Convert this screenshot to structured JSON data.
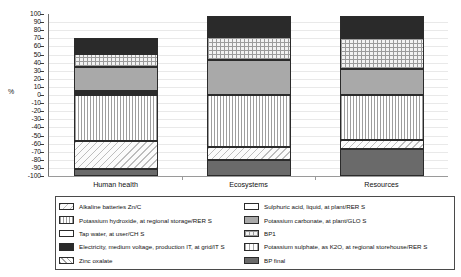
{
  "axis": {
    "ylabel": "%",
    "yticks": [
      100,
      90,
      80,
      70,
      60,
      50,
      40,
      30,
      20,
      10,
      0,
      -10,
      -20,
      -30,
      -40,
      -50,
      -60,
      -70,
      -80,
      -90,
      -100
    ],
    "categories": [
      "Human health",
      "Ecosystems",
      "Resources"
    ]
  },
  "legend": {
    "left": [
      {
        "name": "alkaline-batteries",
        "label": "Alkaline batteries Zn/C",
        "pattern": "p-alkaline"
      },
      {
        "name": "potassium-hydroxide",
        "label": "Potassium hydroxide, at regional storage/RER S",
        "pattern": "p-koh"
      },
      {
        "name": "tap-water",
        "label": "Tap water, at user/CH S",
        "pattern": "p-tap"
      },
      {
        "name": "electricity",
        "label": "Electricity, medium voltage, production IT, at grid/IT S",
        "pattern": "p-elec"
      },
      {
        "name": "zinc-oxalate",
        "label": "Zinc oxalate",
        "pattern": "p-zinc"
      }
    ],
    "right": [
      {
        "name": "sulphuric-acid",
        "label": "Sulphuric acid, liquid, at plant/RER S",
        "pattern": "p-sulph"
      },
      {
        "name": "potassium-carbonate",
        "label": "Potassium carbonate, at plant/GLO S",
        "pattern": "p-kcarb"
      },
      {
        "name": "bp1",
        "label": "BP1",
        "pattern": "p-bp1"
      },
      {
        "name": "potassium-sulphate",
        "label": "Potassium sulphate, as K2O, at regional storehouse/RER S",
        "pattern": "p-ksulph"
      },
      {
        "name": "bp-final",
        "label": "BP final",
        "pattern": "p-bpfinal"
      }
    ]
  },
  "chart_data": {
    "type": "bar",
    "title": "",
    "xlabel": "",
    "ylabel": "%",
    "ylim": [
      -100,
      100
    ],
    "ytick_step": 10,
    "grid": true,
    "stacked": true,
    "legend_position": "bottom",
    "categories": [
      "Human health",
      "Ecosystems",
      "Resources"
    ],
    "series": [
      {
        "name": "Alkaline batteries Zn/C",
        "pattern": "p-alkaline",
        "values": [
          -34,
          -16,
          -12
        ]
      },
      {
        "name": "Potassium hydroxide, at regional storage/RER S",
        "pattern": "p-koh",
        "values": [
          -57,
          -64,
          -55
        ]
      },
      {
        "name": "Tap water, at user/CH S",
        "pattern": "p-tap",
        "values": [
          1,
          0,
          0
        ]
      },
      {
        "name": "Electricity, medium voltage, production IT, at grid/IT S",
        "pattern": "p-elec",
        "values": [
          19,
          26,
          27
        ]
      },
      {
        "name": "Zinc oxalate",
        "pattern": "p-zinc",
        "values": [
          0,
          0,
          0
        ]
      },
      {
        "name": "Sulphuric acid, liquid, at plant/RER S",
        "pattern": "p-sulph",
        "values": [
          2,
          0,
          0
        ]
      },
      {
        "name": "Potassium carbonate, at plant/GLO S",
        "pattern": "p-kcarb",
        "values": [
          29,
          43,
          32
        ]
      },
      {
        "name": "BP1",
        "pattern": "p-bp1",
        "values": [
          17,
          29,
          38
        ]
      },
      {
        "name": "Potassium sulphate, as K2O, at regional storehouse/RER S",
        "pattern": "p-ksulph",
        "values": [
          2,
          0,
          0
        ]
      },
      {
        "name": "BP final",
        "pattern": "p-bpfinal",
        "values": [
          -9,
          -20,
          -33
        ]
      }
    ],
    "bars": [
      {
        "category": "Human health",
        "positive_total": 70,
        "negative_total": -100,
        "positive_segments": [
          {
            "name": "Sulphuric acid, liquid, at plant/RER S",
            "pattern": "p-sulph",
            "from": 1,
            "to": 3
          },
          {
            "name": "Potassium sulphate, as K2O, at regional storehouse/RER S",
            "pattern": "p-ksulph",
            "from": 3,
            "to": 5
          },
          {
            "name": "Potassium carbonate, at plant/GLO S",
            "pattern": "p-kcarb",
            "from": 5,
            "to": 34
          },
          {
            "name": "BP1",
            "pattern": "p-bp1",
            "from": 34,
            "to": 51
          },
          {
            "name": "Electricity, medium voltage, production IT, at grid/IT S",
            "pattern": "p-elec",
            "from": 51,
            "to": 70
          }
        ],
        "negative_segments": [
          {
            "name": "Potassium hydroxide, at regional storage/RER S",
            "pattern": "p-koh",
            "from": 0,
            "to": -57
          },
          {
            "name": "Alkaline batteries Zn/C",
            "pattern": "p-alkaline",
            "from": -57,
            "to": -91
          },
          {
            "name": "BP final",
            "pattern": "p-bpfinal",
            "from": -91,
            "to": -100
          }
        ]
      },
      {
        "category": "Ecosystems",
        "positive_total": 98,
        "negative_total": -100,
        "positive_segments": [
          {
            "name": "Potassium carbonate, at plant/GLO S",
            "pattern": "p-kcarb",
            "from": 0,
            "to": 43
          },
          {
            "name": "BP1",
            "pattern": "p-bp1",
            "from": 43,
            "to": 72
          },
          {
            "name": "Electricity, medium voltage, production IT, at grid/IT S",
            "pattern": "p-elec",
            "from": 72,
            "to": 98
          }
        ],
        "negative_segments": [
          {
            "name": "Potassium hydroxide, at regional storage/RER S",
            "pattern": "p-koh",
            "from": 0,
            "to": -64
          },
          {
            "name": "Alkaline batteries Zn/C",
            "pattern": "p-alkaline",
            "from": -64,
            "to": -80
          },
          {
            "name": "BP final",
            "pattern": "p-bpfinal",
            "from": -80,
            "to": -100
          }
        ]
      },
      {
        "category": "Resources",
        "positive_total": 97,
        "negative_total": -100,
        "positive_segments": [
          {
            "name": "Potassium carbonate, at plant/GLO S",
            "pattern": "p-kcarb",
            "from": 0,
            "to": 32
          },
          {
            "name": "BP1",
            "pattern": "p-bp1",
            "from": 32,
            "to": 70
          },
          {
            "name": "Electricity, medium voltage, production IT, at grid/IT S",
            "pattern": "p-elec",
            "from": 70,
            "to": 97
          }
        ],
        "negative_segments": [
          {
            "name": "Potassium hydroxide, at regional storage/RER S",
            "pattern": "p-koh",
            "from": 0,
            "to": -55
          },
          {
            "name": "Alkaline batteries Zn/C",
            "pattern": "p-alkaline",
            "from": -55,
            "to": -67
          },
          {
            "name": "BP final",
            "pattern": "p-bpfinal",
            "from": -67,
            "to": -100
          }
        ]
      }
    ]
  }
}
